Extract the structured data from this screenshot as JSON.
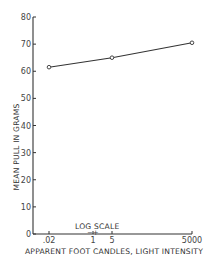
{
  "chart_data": {
    "type": "line",
    "title": "",
    "xlabel": "APPARENT FOOT CANDLES, LIGHT INTENSITY",
    "ylabel": "MEAN PULL IN GRAMS",
    "x_scale_note": "LOG SCALE",
    "x_scale_marks": "−+",
    "x": [
      0.02,
      5,
      5000
    ],
    "x_tick_labels": [
      ".02",
      "1",
      "5",
      "5000"
    ],
    "x_tick_values": [
      0.02,
      1,
      5,
      5000
    ],
    "y_ticks": [
      0,
      10,
      20,
      30,
      40,
      50,
      60,
      70,
      80
    ],
    "ylim": [
      0,
      80
    ],
    "grid": false,
    "legend": null,
    "series": [
      {
        "name": "Mean pull",
        "values": [
          61.5,
          65,
          70.5
        ],
        "marker": "open-circle"
      }
    ]
  },
  "layout": {
    "plot_left": 33,
    "plot_right": 192,
    "y_zero_px": 234,
    "y_top_px": 17,
    "x_tick_px": [
      49,
      93,
      112,
      192
    ],
    "point_px_x": [
      49,
      112,
      192
    ]
  }
}
